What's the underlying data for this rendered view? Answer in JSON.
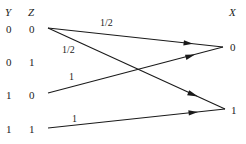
{
  "headers": {
    "y": "Y",
    "z": "Z",
    "x": "X"
  },
  "inputs": [
    {
      "y": "0",
      "z": "0"
    },
    {
      "y": "0",
      "z": "1"
    },
    {
      "y": "1",
      "z": "0"
    },
    {
      "y": "1",
      "z": "1"
    }
  ],
  "outputs": [
    {
      "x": "0"
    },
    {
      "x": "1"
    }
  ],
  "edges": [
    {
      "from": "00",
      "to": "0",
      "label": "1/2"
    },
    {
      "from": "00",
      "to": "1",
      "label": "1/2"
    },
    {
      "from": "10",
      "to": "0",
      "label": "1"
    },
    {
      "from": "11",
      "to": "1",
      "label": "1"
    }
  ]
}
